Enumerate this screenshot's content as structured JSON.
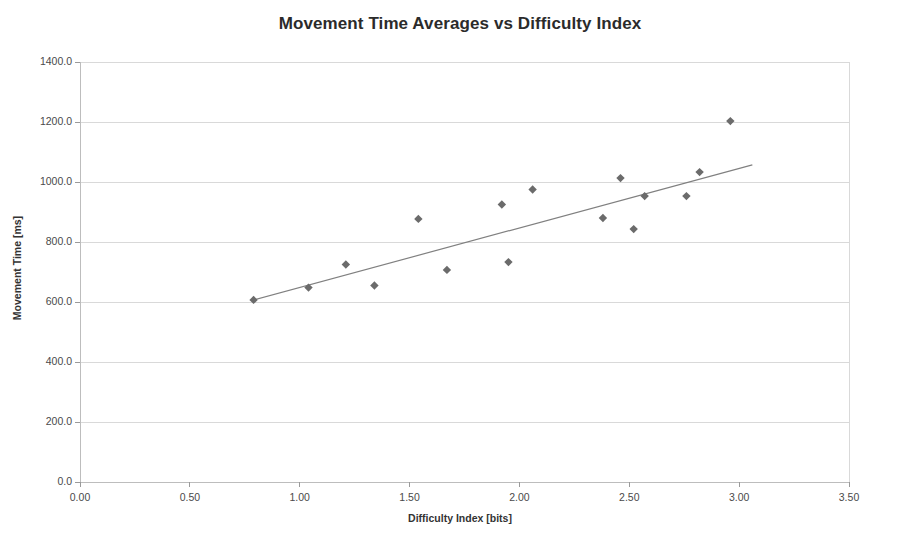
{
  "chart_data": {
    "type": "scatter",
    "title": "Movement Time Averages vs Difficulty Index",
    "xlabel": "Difficulty Index [bits]",
    "ylabel": "Movement Time [ms]",
    "xlim": [
      0.0,
      3.5
    ],
    "ylim": [
      0.0,
      1400.0
    ],
    "xticks": [
      0.0,
      0.5,
      1.0,
      1.5,
      2.0,
      2.5,
      3.0,
      3.5
    ],
    "xtick_labels": [
      "0.00",
      "0.50",
      "1.00",
      "1.50",
      "2.00",
      "2.50",
      "3.00",
      "3.50"
    ],
    "yticks": [
      0.0,
      200.0,
      400.0,
      600.0,
      800.0,
      1000.0,
      1200.0,
      1400.0
    ],
    "ytick_labels": [
      "0.0",
      "200.0",
      "400.0",
      "600.0",
      "800.0",
      "1000.0",
      "1200.0",
      "1400.0"
    ],
    "grid": "horizontal",
    "legend": "none",
    "marker": "diamond",
    "marker_color": "#6b6b6b",
    "trendline_color": "#808080",
    "gridline_color": "#d9d9d9",
    "x": [
      0.79,
      1.04,
      1.21,
      1.34,
      1.54,
      1.67,
      1.92,
      1.95,
      2.06,
      2.38,
      2.46,
      2.52,
      2.57,
      2.76,
      2.82,
      2.96
    ],
    "y": [
      607,
      648,
      725,
      655,
      877,
      707,
      925,
      733,
      975,
      880,
      1013,
      843,
      953,
      953,
      1033,
      1203
    ],
    "points": [
      {
        "x": 0.79,
        "y": 607
      },
      {
        "x": 1.04,
        "y": 648
      },
      {
        "x": 1.21,
        "y": 725
      },
      {
        "x": 1.34,
        "y": 655
      },
      {
        "x": 1.54,
        "y": 877
      },
      {
        "x": 1.67,
        "y": 707
      },
      {
        "x": 1.92,
        "y": 925
      },
      {
        "x": 1.95,
        "y": 733
      },
      {
        "x": 2.06,
        "y": 975
      },
      {
        "x": 2.38,
        "y": 880
      },
      {
        "x": 2.46,
        "y": 1013
      },
      {
        "x": 2.52,
        "y": 843
      },
      {
        "x": 2.57,
        "y": 953
      },
      {
        "x": 2.76,
        "y": 953
      },
      {
        "x": 2.82,
        "y": 1033
      },
      {
        "x": 2.96,
        "y": 1203
      }
    ],
    "trendline": {
      "x0": 0.79,
      "y0": 607,
      "x1": 3.06,
      "y1": 1057
    }
  }
}
